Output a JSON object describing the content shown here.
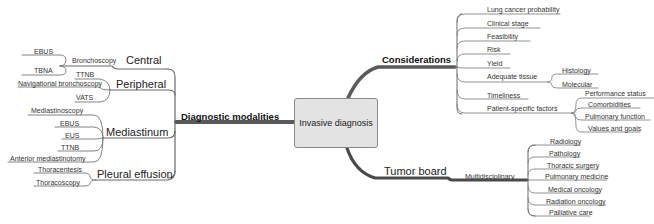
{
  "diagram": {
    "type": "mind-map",
    "center": {
      "label": "Invasive diagnosis"
    },
    "colors": {
      "center_fill": "#e3e3e3",
      "center_border": "#8a8a8a",
      "trunk": "#555555",
      "branch": "#666666",
      "text": "#222222"
    },
    "branches": {
      "diagnostic_modalities": {
        "label": "Diagnostic modalities",
        "children": {
          "central": {
            "label": "Central",
            "sub": {
              "label": "Bronchoscopy",
              "leaves": [
                "EBUS",
                "TBNA"
              ]
            }
          },
          "peripheral": {
            "label": "Peripheral",
            "leaves": [
              "TTNB",
              "Navigational bronchoscopy",
              "VATS"
            ]
          },
          "mediastinum": {
            "label": "Mediastinum",
            "leaves": [
              "Mediastinoscopy",
              "EBUS",
              "EUS",
              "TTNB",
              "Anterior mediastinotomy"
            ]
          },
          "pleural": {
            "label": "Pleural effusion",
            "leaves": [
              "Thoracentesis",
              "Thoracoscopy"
            ]
          }
        }
      },
      "considerations": {
        "label": "Considerations",
        "items": [
          "Lung cancer probability",
          "Clinical stage",
          "Feasibility",
          "Risk",
          "Yield",
          "Adequate tissue",
          "Timeliness",
          "Patient-specific factors"
        ],
        "adequate_tissue_children": [
          "Histology",
          "Molecular"
        ],
        "patient_factors_children": [
          "Performance status",
          "Comorbidities",
          "Pulmonary function",
          "Values and goals"
        ]
      },
      "tumor_board": {
        "label": "Tumor board",
        "sub": {
          "label": "Multidisciplinary",
          "leaves": [
            "Radiology",
            "Pathology",
            "Thoracic surgery",
            "Pulmonary medicine",
            "Medical oncology",
            "Radiation oncology",
            "Palliative care"
          ]
        }
      }
    }
  }
}
